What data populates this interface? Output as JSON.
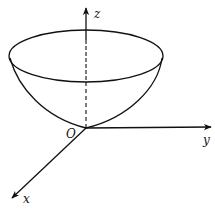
{
  "figure": {
    "type": "3d-surface-sketch",
    "colors": {
      "stroke": "#111111",
      "background": "#ffffff"
    },
    "labels": {
      "z_axis": "z",
      "y_axis": "y",
      "x_axis": "x",
      "origin": "O"
    },
    "elements": {
      "surface": "paraboloid",
      "rim": "ellipse",
      "hidden_axis_segment": "dashed"
    }
  }
}
